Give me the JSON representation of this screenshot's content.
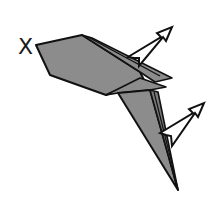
{
  "diagram": {
    "type": "origami-fold-step",
    "labels": {
      "point_marker": "X"
    },
    "colors": {
      "paper_fill": "#8c8c8c",
      "paper_fill_dark": "#7a7a7a",
      "outline": "#111111",
      "arrow_fill": "#ffffff",
      "background": "#ffffff"
    },
    "arrows": [
      {
        "name": "upper-fold-arrow",
        "direction": "up-right"
      },
      {
        "name": "lower-fold-arrow",
        "direction": "up-right"
      }
    ]
  }
}
